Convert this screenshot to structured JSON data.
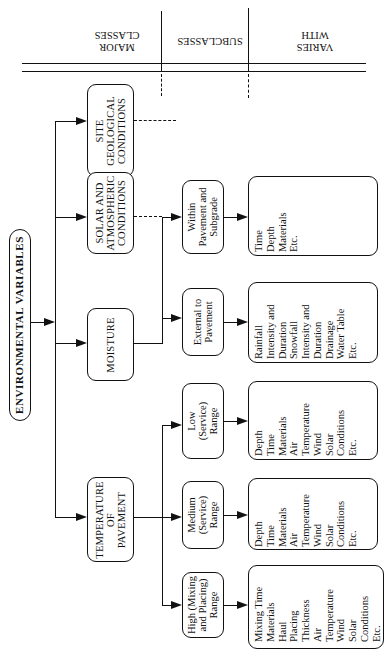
{
  "header": {
    "major_classes": "MAJOR CLASSES",
    "major_line1": "MAJOR",
    "major_line2": "CLASSES",
    "subclasses": "SUBCLASSES",
    "varies_line1": "VARIES",
    "varies_line2": "WITH"
  },
  "root": {
    "label": "ENVIRONMENTAL VARIABLES"
  },
  "major_classes": [
    {
      "id": "site",
      "lines": [
        "SITE",
        "GEOLOGICAL",
        "CONDITIONS"
      ]
    },
    {
      "id": "solar",
      "lines": [
        "SOLAR AND",
        "ATMOSPHERIC",
        "CONDITIONS"
      ]
    },
    {
      "id": "moisture",
      "lines": [
        "MOISTURE"
      ]
    },
    {
      "id": "temperature",
      "lines": [
        "TEMPERATURE",
        "OF",
        "PAVEMENT"
      ]
    }
  ],
  "subclasses": [
    {
      "id": "within",
      "parent": "moisture",
      "lines": [
        "Within",
        "Pavement and",
        "Subgrade"
      ],
      "varies_with": [
        "Time",
        "Depth",
        "Materials",
        "Etc."
      ]
    },
    {
      "id": "external",
      "parent": "moisture",
      "lines": [
        "External to",
        "Pavement"
      ],
      "varies_with": [
        "Rainfall",
        "Intensity and",
        "Duration",
        "Snowfall",
        "Intensity and",
        "Duration",
        "Drainage",
        "Water Table",
        "Etc."
      ]
    },
    {
      "id": "low",
      "parent": "temperature",
      "lines": [
        "Low",
        "(Service)",
        "Range"
      ],
      "varies_with": [
        "Depth",
        "Time",
        "Materials",
        "Air",
        "Temperature",
        "Wind",
        "Solar",
        "Conditions",
        "Etc."
      ]
    },
    {
      "id": "medium",
      "parent": "temperature",
      "lines": [
        "Medium",
        "(Service)",
        "Range"
      ],
      "varies_with": [
        "Depth",
        "Time",
        "Materials",
        "Air",
        "Temperature",
        "Wind",
        "Solar",
        "Conditions",
        "Etc."
      ]
    },
    {
      "id": "high",
      "parent": "temperature",
      "lines": [
        "High (Mixing",
        "and Placing)",
        "Range"
      ],
      "varies_with": [
        "Mixing Time",
        "Materials",
        "Haul",
        "Placing",
        "Thickness",
        "Air",
        "Temperature",
        "Wind",
        "Solar",
        "Conditions",
        "Etc."
      ]
    }
  ]
}
